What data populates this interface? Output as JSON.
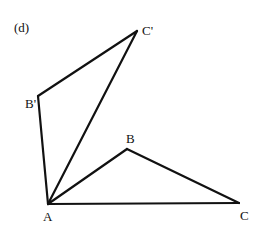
{
  "figure": {
    "panel_label": "(d)",
    "stroke_color": "#111111",
    "background": "#ffffff"
  },
  "vertices": {
    "A": {
      "label": "A",
      "x": 48,
      "y": 204
    },
    "B": {
      "label": "B",
      "x": 127,
      "y": 149
    },
    "C": {
      "label": "C",
      "x": 239,
      "y": 203
    },
    "B_prime": {
      "label": "B'",
      "x": 38,
      "y": 96
    },
    "C_prime": {
      "label": "C'",
      "x": 137,
      "y": 31
    }
  },
  "edges": [
    {
      "from": "A",
      "to": "B"
    },
    {
      "from": "B",
      "to": "C"
    },
    {
      "from": "A",
      "to": "C"
    },
    {
      "from": "A",
      "to": "B_prime"
    },
    {
      "from": "B_prime",
      "to": "C_prime"
    },
    {
      "from": "A",
      "to": "C_prime"
    }
  ],
  "triangles": [
    {
      "name": "ABC",
      "vertices": [
        "A",
        "B",
        "C"
      ]
    },
    {
      "name": "AB'C'",
      "vertices": [
        "A",
        "B_prime",
        "C_prime"
      ]
    }
  ]
}
